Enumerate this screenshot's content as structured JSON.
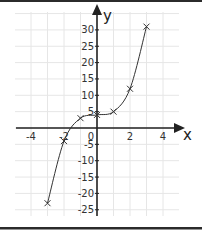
{
  "chart_data": {
    "type": "line",
    "title": "",
    "xlabel": "x",
    "ylabel": "y",
    "xlim": [
      -5,
      5
    ],
    "ylim": [
      -27,
      35
    ],
    "grid": true,
    "x_ticks": [
      -4,
      -2,
      0,
      2,
      4
    ],
    "y_ticks": [
      -25,
      -20,
      -15,
      -10,
      -5,
      5,
      10,
      15,
      20,
      25,
      30
    ],
    "x_tick_labels": [
      "-4",
      "-2",
      "0",
      "2",
      "4"
    ],
    "y_tick_labels": [
      "-25",
      "-20",
      "-15",
      "-10",
      "-5",
      "5",
      "10",
      "15",
      "20",
      "25",
      "30"
    ],
    "marker": "x",
    "smooth_curve": true,
    "x": [
      -3,
      -2,
      -1,
      0,
      1,
      2,
      3
    ],
    "y": [
      -23,
      -4,
      3,
      4,
      5,
      12,
      31
    ],
    "series": [
      {
        "name": "y",
        "x": [
          -3,
          -2,
          -1,
          0,
          1,
          2,
          3
        ],
        "values": [
          -23,
          -4,
          3,
          4,
          5,
          12,
          31
        ]
      }
    ]
  },
  "labels": {
    "x_axis": "x",
    "y_axis": "y",
    "origin": "0"
  },
  "colors": {
    "line": "#333333",
    "grid": "#e6e6e6",
    "axis": "#222222",
    "border": "#2b2b2b"
  }
}
